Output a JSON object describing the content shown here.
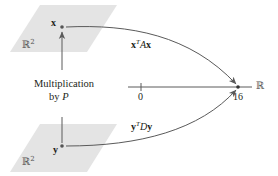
{
  "diagram": {
    "colors": {
      "plane_fill": "#e4e4e4",
      "line": "#5a5a5a",
      "text": "#231f20",
      "point": "#555555"
    },
    "top_plane": {
      "space_label": "ℝ",
      "space_exp": "2",
      "point_label": "x"
    },
    "bottom_plane": {
      "space_label": "ℝ",
      "space_exp": "2",
      "point_label": "y"
    },
    "vertical_arrow": {
      "label_line1": "Multiplication",
      "label_line2_prefix": "by ",
      "label_line2_var": "P"
    },
    "top_curve": {
      "label_a": "x",
      "label_sup": "T",
      "label_b": "A",
      "label_c": "x"
    },
    "bottom_curve": {
      "label_a": "y",
      "label_sup": "T",
      "label_b": "D",
      "label_c": "y"
    },
    "number_line": {
      "label": "ℝ",
      "tick_zero": "0",
      "tick_value": "16"
    }
  }
}
